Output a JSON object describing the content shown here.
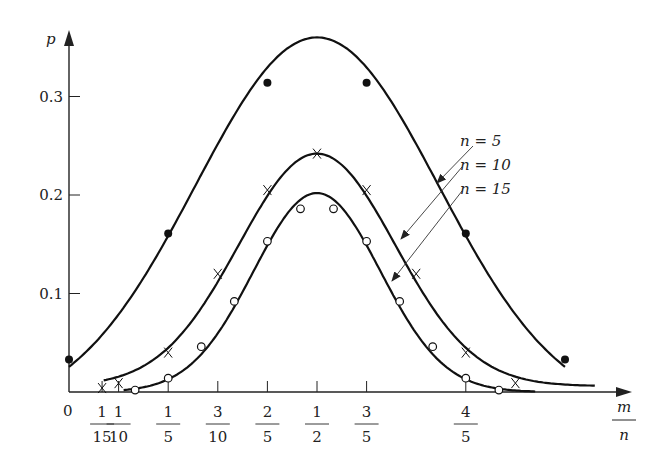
{
  "chart_data": {
    "type": "line",
    "title": "",
    "xlabel_num": "m",
    "xlabel_den": "n",
    "ylabel": "p",
    "x_origin_label": "0",
    "y_ticks": [
      {
        "value": 0.1,
        "label": "0.1"
      },
      {
        "value": 0.2,
        "label": "0.2"
      },
      {
        "value": 0.3,
        "label": "0.3"
      }
    ],
    "x_ticks": [
      {
        "value": 0.0667,
        "num": "1",
        "den": "15"
      },
      {
        "value": 0.1,
        "num": "1",
        "den": "10"
      },
      {
        "value": 0.2,
        "num": "1",
        "den": "5"
      },
      {
        "value": 0.3,
        "num": "3",
        "den": "10"
      },
      {
        "value": 0.4,
        "num": "2",
        "den": "5"
      },
      {
        "value": 0.5,
        "num": "1",
        "den": "2"
      },
      {
        "value": 0.6,
        "num": "3",
        "den": "5"
      },
      {
        "value": 0.8,
        "num": "4",
        "den": "5"
      }
    ],
    "xlim": [
      0,
      1.1
    ],
    "ylim": [
      0,
      0.37
    ],
    "grid": false,
    "series": [
      {
        "name": "n = 5",
        "marker": "filled-circle",
        "x": [
          0,
          0.2,
          0.4,
          0.6,
          0.8,
          1.0
        ],
        "y": [
          0.033,
          0.161,
          0.314,
          0.314,
          0.161,
          0.033
        ],
        "peak": 0.36
      },
      {
        "name": "n = 10",
        "marker": "cross",
        "x": [
          0.0667,
          0.1,
          0.2,
          0.3,
          0.4,
          0.5,
          0.6,
          0.7,
          0.8,
          0.9
        ],
        "y": [
          0.004,
          0.009,
          0.04,
          0.12,
          0.205,
          0.242,
          0.205,
          0.12,
          0.04,
          0.009
        ]
      },
      {
        "name": "n = 15",
        "marker": "open-circle",
        "x": [
          0.1333,
          0.2,
          0.2667,
          0.3333,
          0.4,
          0.4667,
          0.5333,
          0.6,
          0.6667,
          0.7333,
          0.8,
          0.8667
        ],
        "y": [
          0.002,
          0.014,
          0.046,
          0.092,
          0.153,
          0.186,
          0.186,
          0.153,
          0.092,
          0.046,
          0.014,
          0.002
        ],
        "peak": 0.202
      }
    ],
    "legend": {
      "position": "annotations with arrows, right of peak",
      "entries": [
        "n = 5",
        "n = 10",
        "n = 15"
      ]
    }
  },
  "labels": {
    "n5": "n = 5",
    "n10": "n = 10",
    "n15": "n = 15"
  }
}
